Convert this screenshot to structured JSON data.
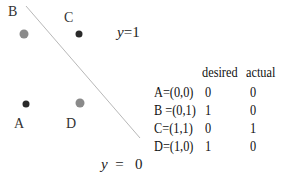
{
  "points": [
    {
      "name": "A",
      "coord": "(0,0)",
      "class": "y=0",
      "color": "#2a2a2a"
    },
    {
      "name": "B",
      "coord": "(0,1)",
      "class": "y=1",
      "color": "#8a8a8a"
    },
    {
      "name": "C",
      "coord": "(1,1)",
      "class": "y=1",
      "color": "#2a2a2a"
    },
    {
      "name": "D",
      "coord": "(1,0)",
      "class": "y=0",
      "color": "#8a8a8a"
    }
  ],
  "region_labels": {
    "upper": {
      "var": "y",
      "op": "=",
      "val": "1"
    },
    "lower": {
      "var": "y",
      "op": "=",
      "val": "0"
    }
  },
  "decision_line_color": "#b8b8b8",
  "table": {
    "headers": [
      "",
      "desired",
      "actual"
    ],
    "rows": [
      {
        "label": "A=(0,0)",
        "desired": "0",
        "actual": "0"
      },
      {
        "label": "B =(0,1)",
        "desired": "1",
        "actual": "0"
      },
      {
        "label": "C=(1,1)",
        "desired": "0",
        "actual": "1"
      },
      {
        "label": "D=(1,0)",
        "desired": "1",
        "actual": "0"
      }
    ]
  }
}
